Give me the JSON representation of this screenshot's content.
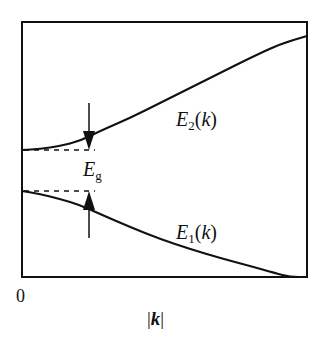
{
  "figure": {
    "type": "band-structure-diagram",
    "frame": {
      "x": 22,
      "y": 22,
      "width": 285,
      "height": 255
    },
    "colors": {
      "stroke": "#111111",
      "background": "#ffffff"
    }
  },
  "labels": {
    "upper_band": {
      "base": "E",
      "sub": "2",
      "arg": "(k)"
    },
    "lower_band": {
      "base": "E",
      "sub": "1",
      "arg": "(k)"
    },
    "gap": {
      "base": "E",
      "sub": "g"
    },
    "origin": "0",
    "x_axis": {
      "open": "|",
      "symbol": "k",
      "close": "|"
    }
  },
  "chart_data": {
    "type": "line",
    "title": "",
    "xlabel": "|k|",
    "ylabel": "",
    "x_origin_label": "0",
    "grid": false,
    "legend": "none (curves labeled inline)",
    "series": [
      {
        "name": "E2(k)",
        "description": "upper band, increasing with |k|",
        "points_px": [
          [
            22,
            150
          ],
          [
            40,
            149
          ],
          [
            60,
            146
          ],
          [
            80,
            141
          ],
          [
            100,
            131
          ],
          [
            130,
            118
          ],
          [
            160,
            103
          ],
          [
            190,
            88
          ],
          [
            220,
            73
          ],
          [
            250,
            58
          ],
          [
            280,
            44
          ],
          [
            307,
            36
          ]
        ]
      },
      {
        "name": "E1(k)",
        "description": "lower band, decreasing with |k|",
        "points_px": [
          [
            22,
            191
          ],
          [
            40,
            194
          ],
          [
            60,
            199
          ],
          [
            80,
            205
          ],
          [
            100,
            214
          ],
          [
            130,
            227
          ],
          [
            160,
            239
          ],
          [
            190,
            249
          ],
          [
            220,
            258
          ],
          [
            250,
            266
          ],
          [
            275,
            273
          ],
          [
            290,
            277
          ],
          [
            307,
            277
          ]
        ]
      }
    ],
    "annotations": [
      {
        "type": "dashed-line",
        "from": [
          22,
          150
        ],
        "to": [
          95,
          150
        ],
        "meaning": "bottom of upper band at k=0"
      },
      {
        "type": "dashed-line",
        "from": [
          22,
          191
        ],
        "to": [
          95,
          191
        ],
        "meaning": "top of lower band at k=0"
      },
      {
        "type": "arrow-down",
        "x": 89,
        "from_y": 103,
        "to_y": 150
      },
      {
        "type": "arrow-up",
        "x": 89,
        "from_y": 238,
        "to_y": 191
      },
      {
        "type": "text",
        "text": "Eg",
        "meaning": "band gap energy"
      }
    ]
  }
}
